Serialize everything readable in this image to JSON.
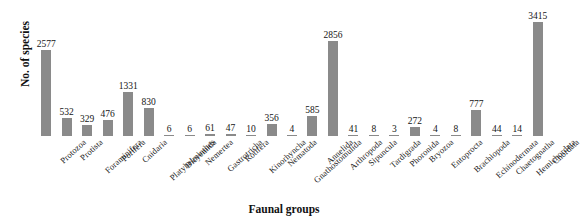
{
  "chart_data": {
    "type": "bar",
    "title": "",
    "xlabel": "Faunal groups",
    "ylabel": "No. of species",
    "ylim": [
      0,
      3415
    ],
    "grid": false,
    "legend": "none",
    "categories": [
      "Protozoa",
      "Protista",
      "Foraminifera",
      "Porifera",
      "Cnidaria",
      "Platyhelminthes",
      "Dicyemida",
      "Nemertea",
      "Gastrotricha",
      "Rotifera",
      "Kinorhyncha",
      "Nematoda",
      "Gnathostomulida",
      "Annelida",
      "Arthropoda",
      "Sipuncula",
      "Tardigrada",
      "Phoronida",
      "Bryozoa",
      "Entoprocta",
      "Brachiopoda",
      "Echinodermata",
      "Chaetognatha",
      "Hemichordata",
      "Chordata"
    ],
    "values": [
      2577,
      532,
      329,
      476,
      1331,
      830,
      6,
      6,
      61,
      47,
      10,
      356,
      4,
      585,
      2856,
      41,
      8,
      3,
      272,
      4,
      8,
      777,
      44,
      14,
      3415
    ],
    "value_labels": [
      "2577",
      "532",
      "329",
      "476",
      "1331",
      "830",
      "6",
      "6",
      "61",
      "47",
      "10",
      "356",
      "4",
      "585",
      "2856",
      "41",
      "8",
      "3",
      "272",
      "4",
      "8",
      "777",
      "44",
      "14",
      "3415"
    ],
    "bar_color": "#8a8a8a",
    "axis_title_color": "#111111"
  }
}
